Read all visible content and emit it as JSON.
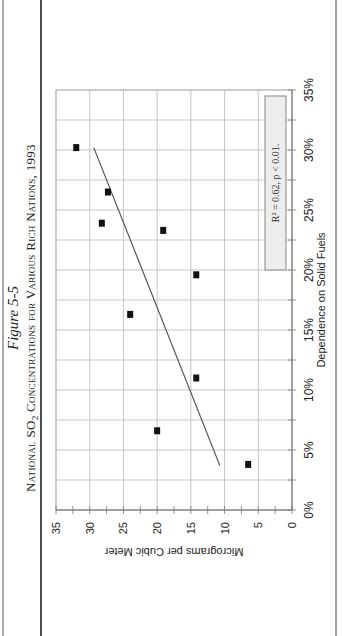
{
  "figure": {
    "label": "Figure 5-5",
    "title": "National SO2 Concentrations for Various Rich Nations, 1993",
    "title_parts": {
      "prefix": "National SO",
      "subscript": "2",
      "suffix": " Concentrations for Various Rich Nations, 1993"
    },
    "annotation": "R² = 0.62, p < 0.01."
  },
  "axes": {
    "x_label": "Dependence on Solid Fuels",
    "y_label": "Micrograms per Cubic Meter",
    "x_ticks": [
      "0%",
      "5%",
      "10%",
      "15%",
      "20%",
      "25%",
      "30%",
      "35%"
    ],
    "y_ticks": [
      "0",
      "5",
      "10",
      "15",
      "20",
      "25",
      "30",
      "35"
    ]
  },
  "colors": {
    "gridline": "#b8b8b8",
    "marker": "#111111",
    "trendline": "#555555",
    "annotation_box_fill": "#ededed",
    "frame": "#333333"
  },
  "chart_data": {
    "type": "scatter",
    "title": "National SO2 Concentrations for Various Rich Nations, 1993",
    "subtitle": "Figure 5-5",
    "xlabel": "Dependence on Solid Fuels",
    "ylabel": "Micrograms per Cubic Meter",
    "xlim": [
      0,
      35
    ],
    "ylim": [
      0,
      35
    ],
    "x_unit": "%",
    "grid": true,
    "orientation": "rotated 90° counter-clockwise on page",
    "points": [
      {
        "x": 30.2,
        "y": 32.0
      },
      {
        "x": 26.5,
        "y": 27.3
      },
      {
        "x": 23.9,
        "y": 28.2
      },
      {
        "x": 23.3,
        "y": 19.1
      },
      {
        "x": 19.6,
        "y": 14.2
      },
      {
        "x": 16.3,
        "y": 24.0
      },
      {
        "x": 11.0,
        "y": 14.2
      },
      {
        "x": 6.6,
        "y": 20.0
      },
      {
        "x": 3.8,
        "y": 6.5
      }
    ],
    "trendline": {
      "x": [
        3.7,
        30.2
      ],
      "y": [
        10.7,
        29.4
      ]
    },
    "annotations": [
      "R² = 0.62, p < 0.01."
    ]
  }
}
